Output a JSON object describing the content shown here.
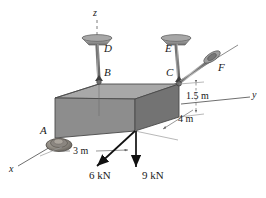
{
  "figure": {
    "type": "engineering-free-body-diagram",
    "canvas": {
      "width": 266,
      "height": 198,
      "background": "#ffffff"
    }
  },
  "colors": {
    "ink": "#1a1a1a",
    "line": "#555555",
    "top_face": "#a3a3a3",
    "front_face": "#8f8f8f",
    "side_face": "#6e6e6e",
    "edge": "#4a4a4a",
    "dimension_line": "#8a8a8a",
    "cable": "#5a5a5a",
    "bracket": "#9a9a9a"
  },
  "axes": [
    {
      "name": "z-axis",
      "label": "z",
      "style": "dashed",
      "label_x": 95,
      "label_y": 10
    },
    {
      "name": "y-axis",
      "label": "y",
      "style": "solid",
      "label_x": 252,
      "label_y": 94
    },
    {
      "name": "x-axis",
      "label": "x",
      "style": "solid",
      "label_x": 10,
      "label_y": 170
    }
  ],
  "points": [
    {
      "id": "A",
      "label": "A",
      "label_x": 40,
      "label_y": 131,
      "support": "ball-and-socket",
      "x": 57,
      "y": 140
    },
    {
      "id": "B",
      "label": "B",
      "label_x": 105,
      "label_y": 72,
      "support": "cable-attachment",
      "x": 99,
      "y": 81
    },
    {
      "id": "C",
      "label": "C",
      "label_x": 163,
      "label_y": 72,
      "support": "cable-attachment",
      "x": 179,
      "y": 83
    },
    {
      "id": "D",
      "label": "D",
      "label_x": 105,
      "label_y": 45,
      "support": "ceiling-anchor",
      "x": 97,
      "y": 42
    },
    {
      "id": "E",
      "label": "E",
      "label_x": 166,
      "label_y": 45,
      "support": "ceiling-anchor",
      "x": 176,
      "y": 42
    },
    {
      "id": "F",
      "label": "F",
      "label_x": 219,
      "label_y": 64,
      "support": "wall-anchor",
      "x": 212,
      "y": 57
    }
  ],
  "cables": [
    {
      "name": "cable-DB",
      "from": "D",
      "to": "B"
    },
    {
      "name": "cable-EC",
      "from": "E",
      "to": "C"
    },
    {
      "name": "cable-CF",
      "from": "C",
      "to": "F"
    }
  ],
  "dimensions": [
    {
      "id": "h",
      "label": "1.5 m",
      "label_x": 190,
      "label_y": 96,
      "orientation": "vertical"
    },
    {
      "id": "d",
      "label": "4 m",
      "label_x": 181,
      "label_y": 119,
      "orientation": "diagonal"
    },
    {
      "id": "w",
      "label": "3 m",
      "label_x": 73,
      "label_y": 152,
      "orientation": "horizontal"
    }
  ],
  "forces": [
    {
      "id": "F1",
      "label": "6 kN",
      "label_x": 92,
      "label_y": 176,
      "direction": "down-left",
      "magnitude": 6,
      "unit": "kN"
    },
    {
      "id": "F2",
      "label": "9 kN",
      "label_x": 144,
      "label_y": 176,
      "direction": "down",
      "magnitude": 9,
      "unit": "kN"
    }
  ]
}
